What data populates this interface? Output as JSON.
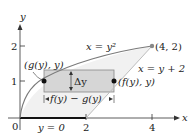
{
  "diagram": {
    "axes": {
      "x_label": "x",
      "y_label": "y",
      "x_ticks": [
        "0",
        "2",
        "4"
      ],
      "y_ticks": [
        "1",
        "2"
      ]
    },
    "curves": {
      "parabola_label": "x = y²",
      "line_label": "x = y + 2"
    },
    "points": {
      "intersection": "(4, 2)",
      "left_point": "(g(y), y)",
      "right_point": "(f(y), y)"
    },
    "strip": {
      "height_label": "Δy",
      "width_label": "f(y) − g(y)"
    },
    "bottom_label": "y = 0",
    "colors": {
      "curve": "#7a7a7a",
      "region_fill": "#f1f1f1",
      "strip_fill": "#d6d6d6",
      "axis": "#333333",
      "bold_segment": "#111111"
    }
  }
}
